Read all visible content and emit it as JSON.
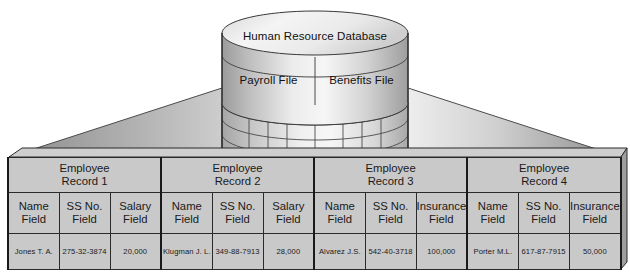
{
  "diagram": {
    "database": {
      "name": "Human Resource Database",
      "files": [
        {
          "label": "Payroll File"
        },
        {
          "label": "Benefits File"
        }
      ]
    },
    "records": [
      {
        "title_line1": "Employee",
        "title_line2": "Record 1",
        "fields": [
          {
            "name_line1": "Name",
            "name_line2": "Field",
            "value": "Jones T. A."
          },
          {
            "name_line1": "SS No.",
            "name_line2": "Field",
            "value": "275-32-3874"
          },
          {
            "name_line1": "Salary",
            "name_line2": "Field",
            "value": "20,000"
          }
        ]
      },
      {
        "title_line1": "Employee",
        "title_line2": "Record 2",
        "fields": [
          {
            "name_line1": "Name",
            "name_line2": "Field",
            "value": "Klugman J. L."
          },
          {
            "name_line1": "SS No.",
            "name_line2": "Field",
            "value": "349-88-7913"
          },
          {
            "name_line1": "Salary",
            "name_line2": "Field",
            "value": "28,000"
          }
        ]
      },
      {
        "title_line1": "Employee",
        "title_line2": "Record 3",
        "fields": [
          {
            "name_line1": "Name",
            "name_line2": "Field",
            "value": "Alvarez J.S."
          },
          {
            "name_line1": "SS No.",
            "name_line2": "Field",
            "value": "542-40-3718"
          },
          {
            "name_line1": "Insurance",
            "name_line2": "Field",
            "value": "100,000"
          }
        ]
      },
      {
        "title_line1": "Employee",
        "title_line2": "Record 4",
        "fields": [
          {
            "name_line1": "Name",
            "name_line2": "Field",
            "value": "Porter M.L."
          },
          {
            "name_line1": "SS No.",
            "name_line2": "Field",
            "value": "617-87-7915"
          },
          {
            "name_line1": "Insurance",
            "name_line2": "Field",
            "value": "50,000"
          }
        ]
      }
    ],
    "colors": {
      "cell_fill": "#c9c9c9",
      "line": "#2b2b2b",
      "cylinder_light": "#f2f2f2",
      "cylinder_dark": "#9a9a9a",
      "funnel_light": "#fbfbfb",
      "funnel_dark": "#8e8e8e"
    }
  }
}
